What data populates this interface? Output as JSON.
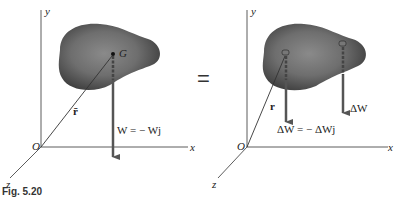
{
  "figure": {
    "caption": "Fig. 5.20",
    "equals_sign": "="
  },
  "left_panel": {
    "axis_y": "y",
    "axis_x": "x",
    "axis_z": "z",
    "origin": "O",
    "centroid": "G",
    "position_vector": "r̄",
    "weight_label": "W = − Wj"
  },
  "right_panel": {
    "axis_y": "y",
    "axis_x": "x",
    "axis_z": "z",
    "origin": "O",
    "position_vector": "r",
    "element_weight_label": "ΔW",
    "element_weight_eq": "ΔW = − ΔWj"
  },
  "colors": {
    "body": "#5a5a5a",
    "arrow": "#5a5a5a",
    "axis": "#333333"
  }
}
